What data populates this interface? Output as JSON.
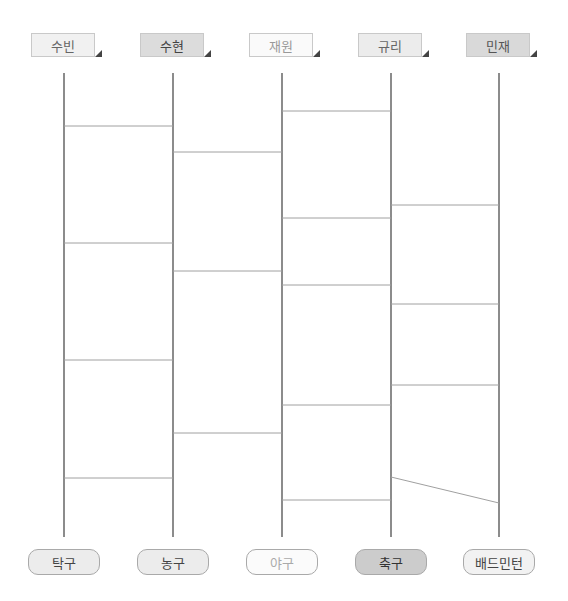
{
  "caption": "",
  "colors": {
    "line": "#8c8c8c",
    "rung": "#a0a0a0"
  },
  "names": [
    {
      "label": "수빈",
      "x": 31,
      "bg": "#f1f1f1",
      "color": "#666666"
    },
    {
      "label": "수현",
      "x": 140,
      "bg": "#dcdcdc",
      "color": "#444444"
    },
    {
      "label": "재원",
      "x": 249,
      "bg": "#fafafa",
      "color": "#999999"
    },
    {
      "label": "규리",
      "x": 358,
      "bg": "#ececec",
      "color": "#666666"
    },
    {
      "label": "민재",
      "x": 466,
      "bg": "#d9d9d9",
      "color": "#555555"
    }
  ],
  "sports": [
    {
      "label": "탁구",
      "x": 28,
      "bg": "#ececec",
      "color": "#444444"
    },
    {
      "label": "농구",
      "x": 137,
      "bg": "#ececec",
      "color": "#444444"
    },
    {
      "label": "야구",
      "x": 246,
      "bg": "#fbfbfb",
      "color": "#aaaaaa"
    },
    {
      "label": "축구",
      "x": 355,
      "bg": "#cccccc",
      "color": "#333333"
    },
    {
      "label": "배드민턴",
      "x": 463,
      "bg": "#f2f2f2",
      "color": "#444444"
    }
  ],
  "ladder": {
    "verticals_x": [
      64,
      173,
      282,
      391,
      499
    ],
    "top_y": 73,
    "bottom_y": 537,
    "rungs": [
      {
        "from": 0,
        "y1": 126,
        "y2": 126
      },
      {
        "from": 0,
        "y1": 243,
        "y2": 243
      },
      {
        "from": 0,
        "y1": 360,
        "y2": 360
      },
      {
        "from": 0,
        "y1": 478,
        "y2": 478
      },
      {
        "from": 1,
        "y1": 152,
        "y2": 152
      },
      {
        "from": 1,
        "y1": 271,
        "y2": 271
      },
      {
        "from": 1,
        "y1": 433,
        "y2": 433
      },
      {
        "from": 2,
        "y1": 111,
        "y2": 111
      },
      {
        "from": 2,
        "y1": 218,
        "y2": 218
      },
      {
        "from": 2,
        "y1": 285,
        "y2": 285
      },
      {
        "from": 2,
        "y1": 405,
        "y2": 405
      },
      {
        "from": 2,
        "y1": 500,
        "y2": 500
      },
      {
        "from": 3,
        "y1": 205,
        "y2": 205
      },
      {
        "from": 3,
        "y1": 304,
        "y2": 304
      },
      {
        "from": 3,
        "y1": 385,
        "y2": 385
      },
      {
        "from": 3,
        "y1": 477,
        "y2": 503
      }
    ]
  }
}
